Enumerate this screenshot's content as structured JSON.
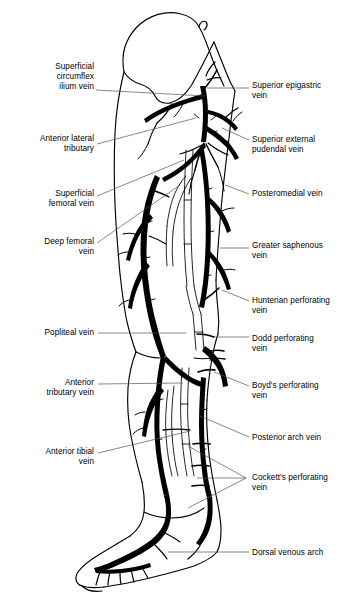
{
  "figure": {
    "view": "lateral leg with superficial and deep venous system",
    "ink_color": "#000000",
    "leader_color": "#555555",
    "background": "#ffffff"
  },
  "labels": {
    "left": [
      {
        "id": "superficial-circumflex-ilium-vein",
        "text": "Superficial\ncircumflex\nilium vein",
        "x": 18,
        "y": 62,
        "width": 76,
        "leader": "M96,90 L205,96"
      },
      {
        "id": "anterior-lateral-tributary",
        "text": "Anterior lateral\ntributary",
        "x": 8,
        "y": 134,
        "width": 86,
        "leader": "M97,144 L196,118"
      },
      {
        "id": "superficial-femoral-vein",
        "text": "Superficial\nfemoral vein",
        "x": 22,
        "y": 189,
        "width": 72,
        "leader": "M97,196 L184,160"
      },
      {
        "id": "deep-femoral-vein",
        "text": "Deep femoral\nvein",
        "x": 16,
        "y": 237,
        "width": 78,
        "leader": "M97,243 L180,185"
      },
      {
        "id": "popliteal-vein",
        "text": "Popliteal vein",
        "x": 16,
        "y": 328,
        "width": 78,
        "leader": "M98,333 L186,333"
      },
      {
        "id": "anterior-tributary-vein",
        "text": "Anterior\ntributary vein",
        "x": 18,
        "y": 378,
        "width": 76,
        "leader": "M98,384 L183,383"
      },
      {
        "id": "anterior-tibial-vein",
        "text": "Anterior tibial\nvein",
        "x": 16,
        "y": 447,
        "width": 78,
        "leader": "M98,453 L190,431"
      }
    ],
    "right": [
      {
        "id": "superior-epigastric-vein",
        "text": "Superior epigastric\nvein",
        "x": 252,
        "y": 81,
        "width": 90,
        "leader": "M207,88 L249,88"
      },
      {
        "id": "superior-external-pudendal-vein",
        "text": "Superior external\npudendal vein",
        "x": 252,
        "y": 135,
        "width": 90,
        "leader": "M222,128 L249,140"
      },
      {
        "id": "posteromedial-vein",
        "text": "Posteromedial vein",
        "x": 252,
        "y": 189,
        "width": 90,
        "leader": "M225,185 L249,194"
      },
      {
        "id": "greater-saphenous-vein",
        "text": "Greater saphenous\nvein",
        "x": 252,
        "y": 241,
        "width": 90,
        "leader": "M220,248 L249,248"
      },
      {
        "id": "hunterian-perforating-vein",
        "text": "Hunterian perforating\nvein",
        "x": 252,
        "y": 296,
        "width": 90,
        "leader": "M222,290 L249,301"
      },
      {
        "id": "dodd-perforating-vein",
        "text": "Dodd perforating\nvein",
        "x": 252,
        "y": 334,
        "width": 90,
        "leader": "M215,337 L249,337"
      },
      {
        "id": "boyds-perforating-vein",
        "text": "Boyd's perforating\nvein",
        "x": 252,
        "y": 381,
        "width": 90,
        "leader": "M214,372 L249,386"
      },
      {
        "id": "posterior-arch-vein",
        "text": "Posterior arch vein",
        "x": 252,
        "y": 433,
        "width": 90,
        "leader": "M200,416 L249,437"
      },
      {
        "id": "cocketts-perforating-vein",
        "text": "Cockett's perforating\nvein",
        "x": 252,
        "y": 473,
        "width": 90,
        "leader": "M188,446 L246,478 M197,478 L246,478 M188,508 L246,478"
      },
      {
        "id": "dorsal-venous-arch",
        "text": "Dorsal venous arch",
        "x": 252,
        "y": 548,
        "width": 90,
        "leader": "M168,552 L249,552"
      }
    ]
  },
  "anatomy": {
    "body_outline_id": "leg-outline",
    "regions": [
      "hip",
      "thigh",
      "knee",
      "calf",
      "ankle",
      "foot"
    ],
    "vessel_groups": [
      "saphenofemoral-junction",
      "greater-saphenous-trunk",
      "posteromedial-trunk",
      "deep-femoral-system",
      "popliteal-system",
      "posterior-arch-vein",
      "perforating-veins",
      "dorsal-venous-arch"
    ]
  }
}
